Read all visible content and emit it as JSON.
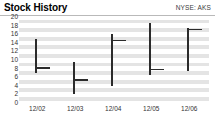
{
  "header": {
    "title": "Stock History",
    "ticker": "NYSE: AKS"
  },
  "chart_data": {
    "type": "bar",
    "subtype": "hlc-price-bars",
    "title": "Stock History",
    "series_label": "NYSE: AKS",
    "xlabel": "",
    "ylabel": "",
    "ylim": [
      0,
      20
    ],
    "yticks": [
      20,
      18,
      16,
      14,
      12,
      10,
      8,
      6,
      4,
      2,
      0
    ],
    "ytick_labels": [
      "20",
      "18",
      "16",
      "14",
      "12",
      "10",
      "8",
      "6",
      "4",
      "2",
      "0"
    ],
    "grid": true,
    "grid_style": "alternating-horizontal-bands",
    "legend": false,
    "categories": [
      "12/02",
      "12/03",
      "12/04",
      "12/05",
      "12/06"
    ],
    "bars": [
      {
        "label": "12/02",
        "high": 15.0,
        "low": 7.0,
        "close": 8.3
      },
      {
        "label": "12/03",
        "high": 9.5,
        "low": 2.0,
        "close": 5.5
      },
      {
        "label": "12/04",
        "high": 16.0,
        "low": 4.0,
        "close": 14.7
      },
      {
        "label": "12/05",
        "high": 18.5,
        "low": 6.5,
        "close": 8.0
      },
      {
        "label": "12/06",
        "high": 17.5,
        "low": 7.5,
        "close": 17.3
      }
    ],
    "series": [
      {
        "name": "High",
        "values": [
          15.0,
          9.5,
          16.0,
          18.5,
          17.5
        ]
      },
      {
        "name": "Low",
        "values": [
          7.0,
          2.0,
          4.0,
          6.5,
          7.5
        ]
      },
      {
        "name": "Close",
        "values": [
          8.3,
          5.5,
          14.7,
          8.0,
          17.3
        ]
      }
    ]
  },
  "style": {
    "bar_color": "#2b2b2b",
    "band_color": "#e4e4e4",
    "plot_background": "#ffffff",
    "header_rule_color": "#b9b9b9",
    "text_color": "#333333"
  }
}
